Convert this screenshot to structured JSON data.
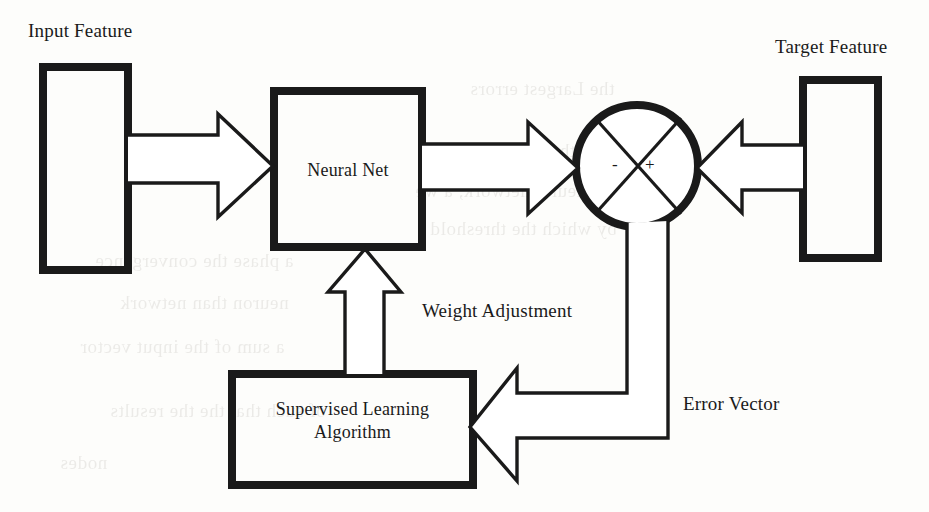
{
  "figure": {
    "ink_color": "#1a1a1a",
    "paper_color": "#fdfdfb"
  },
  "nodes": {
    "input_feature": {
      "caption": "Input Feature",
      "x": 43,
      "y": 67,
      "w": 85,
      "h": 203
    },
    "neural_net": {
      "label": "Neural Net",
      "x": 274,
      "y": 91,
      "w": 148,
      "h": 156
    },
    "summing_junction": {
      "minus": "-",
      "plus": "+",
      "cx": 637,
      "cy": 166,
      "r": 61
    },
    "target_feature": {
      "caption": "Target Feature",
      "x": 803,
      "y": 80,
      "w": 75,
      "h": 178
    },
    "supervised_learning": {
      "label_line1": "Supervised Learning",
      "label_line2": "Algorithm",
      "x": 232,
      "y": 374,
      "w": 241,
      "h": 111
    }
  },
  "edges": {
    "input_to_net": {
      "name": "input-feature-to-neural-net"
    },
    "net_to_junction": {
      "name": "neural-net-to-summing-junction"
    },
    "target_to_junction": {
      "name": "target-feature-to-summing-junction"
    },
    "junction_to_algorithm": {
      "label": "Error Vector"
    },
    "algorithm_to_net": {
      "label": "Weight Adjustment"
    }
  },
  "labels": {
    "input_feature": "Input Feature",
    "target_feature": "Target Feature",
    "weight_adjustment": "Weight Adjustment",
    "error_vector": "Error Vector",
    "neural_net": "Neural Net",
    "supervised_learning_l1": "Supervised Learning",
    "supervised_learning_l2": "Algorithm",
    "sign_minus": "-",
    "sign_plus": "+"
  },
  "bleed_through_text": [
    "the Largest errors",
    "in the output of the",
    "neural network, a we",
    "by which the threshold",
    "a phase the convergence",
    "neuron than network",
    "a sum of the input vector",
    "of such that the the results",
    "nodes"
  ]
}
